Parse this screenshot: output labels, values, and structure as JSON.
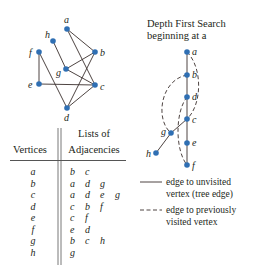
{
  "colors": {
    "node": "#2f6fb3",
    "edge": "#3a2f2c",
    "text": "#231f20"
  },
  "graph": {
    "nodes": [
      {
        "id": "a",
        "label": "a",
        "x": 67,
        "y": 29
      },
      {
        "id": "h",
        "label": "h",
        "x": 53,
        "y": 41
      },
      {
        "id": "f",
        "label": "f",
        "x": 39,
        "y": 52
      },
      {
        "id": "b",
        "label": "b",
        "x": 95,
        "y": 52
      },
      {
        "id": "g",
        "label": "g",
        "x": 66,
        "y": 69
      },
      {
        "id": "e",
        "label": "e",
        "x": 39,
        "y": 84
      },
      {
        "id": "c",
        "label": "c",
        "x": 95,
        "y": 85
      },
      {
        "id": "d",
        "label": "d",
        "x": 67,
        "y": 108
      }
    ],
    "edges": [
      [
        "a",
        "b"
      ],
      [
        "a",
        "c"
      ],
      [
        "h",
        "g"
      ],
      [
        "f",
        "e"
      ],
      [
        "f",
        "d"
      ],
      [
        "b",
        "g"
      ],
      [
        "b",
        "d"
      ],
      [
        "g",
        "c"
      ],
      [
        "e",
        "c"
      ],
      [
        "c",
        "d"
      ]
    ]
  },
  "table": {
    "header_line1": "Lists of",
    "col_vertices": "Vertices",
    "col_adjacencies": "Adjacencies",
    "rows": [
      {
        "vertex": "a",
        "adj": [
          "b",
          "c"
        ]
      },
      {
        "vertex": "b",
        "adj": [
          "a",
          "d",
          "g"
        ]
      },
      {
        "vertex": "c",
        "adj": [
          "a",
          "d",
          "e",
          "g"
        ]
      },
      {
        "vertex": "d",
        "adj": [
          "c",
          "b",
          "f"
        ]
      },
      {
        "vertex": "e",
        "adj": [
          "c",
          "f"
        ]
      },
      {
        "vertex": "f",
        "adj": [
          "e",
          "d"
        ]
      },
      {
        "vertex": "g",
        "adj": [
          "b",
          "c",
          "h"
        ]
      },
      {
        "vertex": "h",
        "adj": [
          "g"
        ]
      }
    ]
  },
  "dfs": {
    "title_line1": "Depth First Search",
    "title_line2": "beginning at a",
    "nodes": [
      {
        "id": "a",
        "label": "a"
      },
      {
        "id": "b",
        "label": "b"
      },
      {
        "id": "d",
        "label": "d"
      },
      {
        "id": "c",
        "label": "c"
      },
      {
        "id": "g",
        "label": "g"
      },
      {
        "id": "e",
        "label": "e"
      },
      {
        "id": "f",
        "label": "f"
      },
      {
        "id": "h",
        "label": "h"
      }
    ],
    "tree_edges": [
      [
        "a",
        "b"
      ],
      [
        "b",
        "d"
      ],
      [
        "d",
        "c"
      ],
      [
        "c",
        "e"
      ],
      [
        "e",
        "f"
      ],
      [
        "c",
        "g"
      ],
      [
        "g",
        "h"
      ]
    ],
    "back_edges": [
      [
        "a",
        "c"
      ],
      [
        "b",
        "g"
      ],
      [
        "d",
        "f"
      ]
    ]
  },
  "legend": {
    "solid_line1": "edge to unvisited",
    "solid_line2": "vertex (tree edge)",
    "dashed_line1": "edge to previously",
    "dashed_line2": "visited vertex"
  }
}
